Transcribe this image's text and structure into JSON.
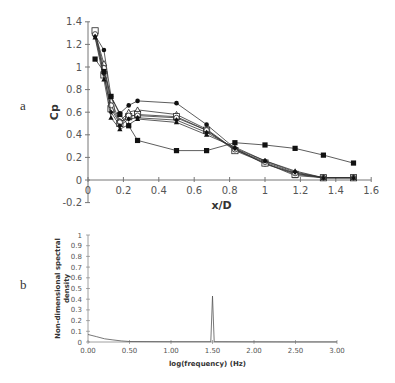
{
  "panels": {
    "a_label": "a",
    "b_label": "b"
  },
  "chart_data": [
    {
      "type": "line",
      "panel": "a",
      "title": "",
      "xlabel": "x/D",
      "ylabel": "Cp",
      "xlim": [
        0,
        1.6
      ],
      "ylim": [
        -0.2,
        1.4
      ],
      "xticks": [
        "0",
        "0.2",
        "0.4",
        "0.6",
        "0.8",
        "1",
        "1.2",
        "1.4",
        "1.6"
      ],
      "yticks": [
        "-0.2",
        "0",
        "0.2",
        "0.4",
        "0.6",
        "0.8",
        "1",
        "1.2",
        "1.4"
      ],
      "grid": false,
      "legend": "none",
      "x": [
        0.04,
        0.09,
        0.13,
        0.18,
        0.23,
        0.28,
        0.5,
        0.67,
        0.83,
        1.0,
        1.17,
        1.33,
        1.5
      ],
      "series": [
        {
          "name": "filled-circle",
          "marker": "circle-filled",
          "values": [
            1.28,
            1.15,
            0.74,
            0.59,
            0.66,
            0.7,
            0.68,
            0.49,
            0.28,
            0.14,
            0.06,
            0.02,
            0.02
          ]
        },
        {
          "name": "open-triangle",
          "marker": "triangle-open",
          "values": [
            1.3,
            1.03,
            0.7,
            0.52,
            0.6,
            0.62,
            0.58,
            0.45,
            0.27,
            0.15,
            0.04,
            0.02,
            0.02
          ]
        },
        {
          "name": "open-square",
          "marker": "square-open",
          "values": [
            1.32,
            0.93,
            0.63,
            0.5,
            0.56,
            0.58,
            0.56,
            0.44,
            0.26,
            0.15,
            0.05,
            0.02,
            0.02
          ]
        },
        {
          "name": "open-circle",
          "marker": "circle-open",
          "values": [
            1.29,
            0.99,
            0.66,
            0.51,
            0.57,
            0.57,
            0.55,
            0.44,
            0.27,
            0.16,
            0.06,
            0.02,
            0.02
          ]
        },
        {
          "name": "filled-diamond",
          "marker": "diamond-filled",
          "values": [
            1.27,
            0.94,
            0.6,
            0.48,
            0.54,
            0.55,
            0.53,
            0.42,
            0.28,
            0.17,
            0.07,
            0.02,
            0.02
          ]
        },
        {
          "name": "filled-triangle",
          "marker": "triangle-filled",
          "values": [
            1.26,
            0.89,
            0.55,
            0.45,
            0.49,
            0.54,
            0.51,
            0.4,
            0.29,
            0.17,
            0.08,
            0.02,
            0.02
          ]
        },
        {
          "name": "filled-square",
          "marker": "square-filled",
          "values": [
            1.07,
            0.96,
            0.74,
            0.58,
            0.48,
            0.35,
            0.26,
            0.26,
            0.33,
            0.31,
            0.28,
            0.22,
            0.15
          ]
        }
      ]
    },
    {
      "type": "line",
      "panel": "b",
      "title": "",
      "xlabel": "log(frequency) (Hz)",
      "ylabel": "Non-dimensional spectral density",
      "xlim": [
        0,
        3
      ],
      "ylim": [
        0,
        1
      ],
      "xticks": [
        "0.00",
        "0.50",
        "1.00",
        "1.50",
        "2.00",
        "2.50",
        "3.00"
      ],
      "yticks": [
        "0",
        "0.1",
        "0.2",
        "0.3",
        "0.4",
        "0.5",
        "0.6",
        "0.7",
        "0.8",
        "0.9",
        "1"
      ],
      "grid": false,
      "legend": "none",
      "x": [
        0.0,
        0.1,
        0.2,
        0.3,
        0.4,
        0.5,
        1.0,
        1.48,
        1.5,
        1.52,
        2.0,
        2.5,
        3.0
      ],
      "series": [
        {
          "name": "spectrum",
          "values": [
            0.07,
            0.05,
            0.03,
            0.02,
            0.01,
            0.005,
            0.003,
            0.003,
            0.43,
            0.003,
            0.002,
            0.001,
            0.001
          ]
        }
      ]
    }
  ]
}
